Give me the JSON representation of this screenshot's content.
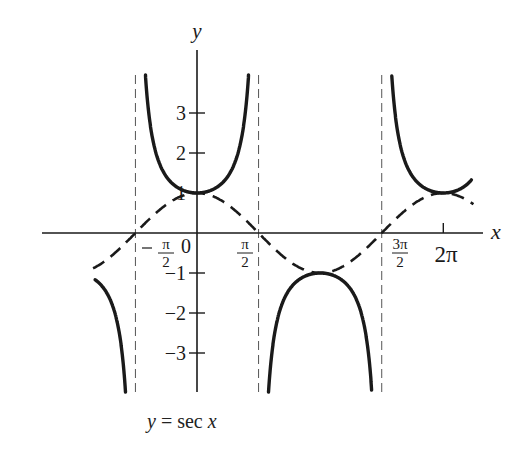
{
  "chart_data": {
    "type": "line",
    "title": "",
    "caption": {
      "lhs": "y",
      "eq": "=",
      "fn": "sec",
      "arg": "x"
    },
    "xlabel": "x",
    "ylabel": "y",
    "xlim": [
      -2.6,
      7.1
    ],
    "ylim": [
      -3.9,
      3.9
    ],
    "grid": false,
    "legend": null,
    "x_ticks": [
      {
        "value": -1.5708,
        "label_num": "π",
        "label_den": "2",
        "sign": "−"
      },
      {
        "value": 0,
        "label": "0"
      },
      {
        "value": 1.5708,
        "label_num": "π",
        "label_den": "2",
        "sign": ""
      },
      {
        "value": 4.7124,
        "label_num": "3π",
        "label_den": "2",
        "sign": ""
      },
      {
        "value": 6.2832,
        "label": "2π"
      }
    ],
    "y_ticks": [
      {
        "value": 3,
        "label": "3"
      },
      {
        "value": 2,
        "label": "2"
      },
      {
        "value": 1,
        "label": "1"
      },
      {
        "value": -1,
        "label": "−1"
      },
      {
        "value": -2,
        "label": "−2"
      },
      {
        "value": -3,
        "label": "−3"
      }
    ],
    "asymptotes_x": [
      -1.5708,
      1.5708,
      4.7124
    ],
    "series": [
      {
        "name": "sec x",
        "style": "solid",
        "function": "1/cos(x)",
        "branches": [
          [
            -2.6,
            -1.82
          ],
          [
            -1.32,
            1.32
          ],
          [
            1.82,
            4.46
          ],
          [
            4.96,
            7.0
          ]
        ],
        "sample_points": [
          {
            "x": -3.1416,
            "y": -1
          },
          {
            "x": 0,
            "y": 1
          },
          {
            "x": 1.0472,
            "y": 2
          },
          {
            "x": 3.1416,
            "y": -1
          },
          {
            "x": 6.2832,
            "y": 1
          }
        ]
      },
      {
        "name": "cos x",
        "style": "dashed",
        "function": "cos(x)",
        "range": [
          -2.65,
          7.05
        ],
        "sample_points": [
          {
            "x": -3.1416,
            "y": -1
          },
          {
            "x": -1.5708,
            "y": 0
          },
          {
            "x": 0,
            "y": 1
          },
          {
            "x": 1.5708,
            "y": 0
          },
          {
            "x": 3.1416,
            "y": -1
          },
          {
            "x": 4.7124,
            "y": 0
          },
          {
            "x": 6.2832,
            "y": 1
          }
        ]
      }
    ]
  },
  "layout": {
    "origin_px": [
      197,
      233
    ],
    "unit_x_px": 39.2,
    "unit_y_px": 40,
    "color": "#1a1a1a"
  }
}
